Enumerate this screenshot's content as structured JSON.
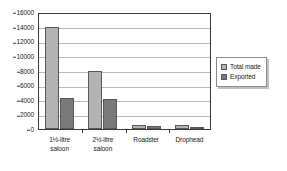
{
  "chart_data": {
    "type": "bar",
    "title": "",
    "xlabel": "",
    "ylabel": "",
    "ylim": [
      0,
      16000
    ],
    "ytick_step": 2000,
    "yticks": [
      "0",
      "2000",
      "4000",
      "6000",
      "8000",
      "10000",
      "12000",
      "14000",
      "16000"
    ],
    "grid": true,
    "legend_position": "right-outside",
    "categories": [
      "1½-litre saloon",
      "2½-litre saloon",
      "Roadster",
      "Drophead"
    ],
    "category_lines": [
      [
        "1½-litre",
        "saloon"
      ],
      [
        "2½-litre",
        "saloon"
      ],
      [
        "Roadster"
      ],
      [
        "Drophead"
      ]
    ],
    "series": [
      {
        "name": "Total made",
        "color": "#b3b3b3",
        "values": [
          14000,
          7900,
          500,
          500
        ]
      },
      {
        "name": "Exported",
        "color": "#7a7a7a",
        "values": [
          4300,
          4100,
          400,
          300
        ]
      }
    ]
  },
  "legend": {
    "items": [
      {
        "label": "Total made",
        "color": "#b3b3b3"
      },
      {
        "label": "Exported",
        "color": "#7a7a7a"
      }
    ]
  },
  "colors": {
    "total_made": "#b3b3b3",
    "exported": "#7a7a7a",
    "gridline": "#b9b9b9",
    "axis": "#3a3a3a",
    "text": "#1a1a1a",
    "background": "#ffffff"
  }
}
